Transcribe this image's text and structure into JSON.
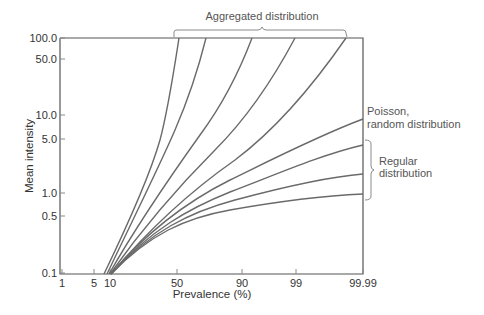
{
  "chart_data": {
    "type": "line",
    "title": "",
    "xlabel": "Prevalence (%)",
    "ylabel": "Mean intensity",
    "xscale": "probit-like (nonlinear)",
    "yscale": "log",
    "x_ticks": [
      "1",
      "5",
      "10",
      "50",
      "90",
      "99",
      "99.99"
    ],
    "y_ticks": [
      "100.0",
      "50.0",
      "10.0",
      "5.0",
      "1.0",
      "0.5",
      "0.1"
    ],
    "ylim": [
      0.1,
      100
    ],
    "xlim": [
      1,
      99.99
    ],
    "grid": false,
    "annotations": [
      {
        "text": "Aggregated distribution",
        "target": "top brace over 5 steep curves"
      },
      {
        "text": "Poisson, random distribution",
        "target": "curve ending at ~9 mean intensity"
      },
      {
        "text": "Regular distribution",
        "target": "brace over 3 lowest curves"
      }
    ],
    "series": [
      {
        "name": "Aggregated 1",
        "group": "aggregated",
        "points": [
          [
            7,
            0.1
          ],
          [
            25,
            1.0
          ],
          [
            40,
            10.0
          ],
          [
            50,
            100.0
          ]
        ]
      },
      {
        "name": "Aggregated 2",
        "group": "aggregated",
        "points": [
          [
            8,
            0.1
          ],
          [
            30,
            1.0
          ],
          [
            50,
            10.0
          ],
          [
            65,
            100.0
          ]
        ]
      },
      {
        "name": "Aggregated 3",
        "group": "aggregated",
        "points": [
          [
            9,
            0.1
          ],
          [
            35,
            1.0
          ],
          [
            65,
            10.0
          ],
          [
            86,
            100.0
          ]
        ]
      },
      {
        "name": "Aggregated 4",
        "group": "aggregated",
        "points": [
          [
            10,
            0.1
          ],
          [
            38,
            1.0
          ],
          [
            75,
            10.0
          ],
          [
            97,
            100.0
          ]
        ]
      },
      {
        "name": "Aggregated 5",
        "group": "aggregated",
        "points": [
          [
            10,
            0.1
          ],
          [
            40,
            1.0
          ],
          [
            85,
            10.0
          ],
          [
            99.9,
            100.0
          ]
        ]
      },
      {
        "name": "Poisson",
        "group": "random",
        "points": [
          [
            10,
            0.1
          ],
          [
            50,
            0.7
          ],
          [
            90,
            2.3
          ],
          [
            99,
            4.6
          ],
          [
            99.99,
            9.2
          ]
        ]
      },
      {
        "name": "Regular 1",
        "group": "regular",
        "points": [
          [
            10,
            0.1
          ],
          [
            50,
            0.6
          ],
          [
            90,
            1.6
          ],
          [
            99,
            2.7
          ],
          [
            99.99,
            4.0
          ]
        ]
      },
      {
        "name": "Regular 2",
        "group": "regular",
        "points": [
          [
            10,
            0.1
          ],
          [
            50,
            0.55
          ],
          [
            90,
            1.1
          ],
          [
            99,
            1.5
          ],
          [
            99.99,
            1.7
          ]
        ]
      },
      {
        "name": "Regular 3",
        "group": "regular",
        "points": [
          [
            10,
            0.1
          ],
          [
            50,
            0.5
          ],
          [
            90,
            0.8
          ],
          [
            99,
            0.9
          ],
          [
            99.99,
            0.95
          ]
        ]
      }
    ]
  },
  "render": {
    "plot": {
      "left": 60,
      "right": 363,
      "top": 38,
      "bottom": 274
    },
    "x_tick_px": [
      62,
      94,
      110,
      177,
      242,
      296,
      363
    ],
    "y_tick_px": [
      38,
      59,
      115,
      139,
      193,
      216,
      273
    ],
    "curves": [
      "M104,274 C130,220 150,175 160,140 C168,110 174,70 179,38",
      "M107,274 C135,215 160,165 175,130 C188,100 198,70 206,38",
      "M109,274 C140,220 175,170 200,135 C220,108 238,75 252,38",
      "M110,274 C145,225 185,180 215,150 C245,120 270,85 295,38",
      "M111,274 C150,228 195,188 235,160 C275,130 310,90 346,38",
      "M111,274 C150,228 190,200 230,180 C275,158 320,135 363,119",
      "M111,274 C150,230 190,208 230,192 C275,175 320,155 363,145",
      "M111,274 C150,232 190,212 235,200 C280,188 325,177 363,174",
      "M111,274 C150,234 185,218 230,210 C275,202 320,196 363,194"
    ]
  },
  "labels": {
    "aggregated": "Aggregated distribution",
    "poisson_line1": "Poisson,",
    "poisson_line2": "random distribution",
    "regular_line1": "Regular",
    "regular_line2": "distribution"
  }
}
